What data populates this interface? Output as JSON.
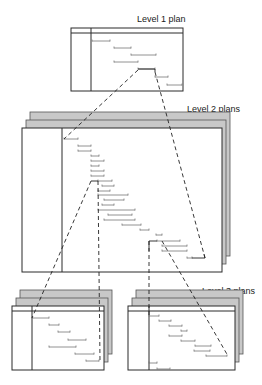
{
  "labels": {
    "level1": "Level 1 plan",
    "level2": "Level 2 plans",
    "level3": "Level 3 plans"
  },
  "colors": {
    "frame": "#2a2a2a",
    "back_layer": "#c8c8c8",
    "bar": "#777777",
    "dashed": "#222222"
  },
  "level1": {
    "frame": {
      "x": 71,
      "y": 28,
      "w": 112,
      "h": 63,
      "header_h": 5,
      "divider_x": 91
    },
    "bars": [
      [
        92,
        41,
        110
      ],
      [
        114,
        48,
        131
      ],
      [
        131,
        55,
        156
      ],
      [
        114,
        62,
        138
      ],
      [
        138,
        69,
        155
      ],
      [
        155,
        77,
        168
      ],
      [
        167,
        85,
        182
      ]
    ]
  },
  "level2": {
    "layers": 3,
    "offset": 4,
    "frame": {
      "x": 22,
      "y": 128,
      "w": 200,
      "h": 144,
      "divider_x": 62
    },
    "bars": [
      [
        64,
        139,
        78
      ],
      [
        78,
        146,
        91
      ],
      [
        78,
        151,
        91
      ],
      [
        91,
        156,
        99
      ],
      [
        91,
        161,
        104
      ],
      [
        91,
        166,
        99
      ],
      [
        91,
        171,
        104
      ],
      [
        91,
        176,
        104
      ],
      [
        98,
        181,
        112
      ],
      [
        102,
        186,
        114
      ],
      [
        98,
        191,
        110
      ],
      [
        98,
        195,
        128
      ],
      [
        104,
        200,
        124
      ],
      [
        102,
        205,
        114
      ],
      [
        98,
        210,
        135
      ],
      [
        108,
        215,
        132
      ],
      [
        104,
        220,
        135
      ],
      [
        122,
        225,
        141
      ],
      [
        140,
        230,
        149
      ],
      [
        156,
        235,
        162
      ],
      [
        157,
        241,
        180
      ],
      [
        162,
        246,
        187
      ],
      [
        162,
        251,
        187
      ],
      [
        187,
        258,
        192
      ]
    ]
  },
  "level3_left": {
    "layers": 3,
    "offset": 4,
    "frame": {
      "x": 12,
      "y": 306,
      "w": 92,
      "h": 64,
      "header_h": 5,
      "divider_x": 32
    },
    "bars": [
      [
        32,
        318,
        49
      ],
      [
        49,
        325,
        59
      ],
      [
        58,
        332,
        70
      ],
      [
        68,
        340,
        86
      ],
      [
        49,
        347,
        76
      ],
      [
        75,
        354,
        94
      ],
      [
        86,
        361,
        99
      ]
    ]
  },
  "level3_right": {
    "layers": 3,
    "offset": 4,
    "frame": {
      "x": 128,
      "y": 306,
      "w": 107,
      "h": 64,
      "header_h": 5,
      "divider_x": 149
    },
    "bars": [
      [
        149,
        316,
        159
      ],
      [
        159,
        321,
        171
      ],
      [
        169,
        326,
        182
      ],
      [
        181,
        331,
        187
      ],
      [
        169,
        336,
        182
      ],
      [
        181,
        341,
        195
      ],
      [
        195,
        346,
        211
      ],
      [
        194,
        351,
        210
      ],
      [
        206,
        356,
        227
      ],
      [
        149,
        363,
        157
      ],
      [
        157,
        369,
        170
      ]
    ]
  }
}
